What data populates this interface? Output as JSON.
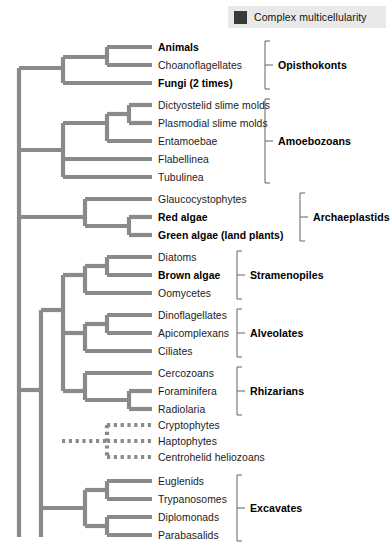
{
  "legend": {
    "swatch_color": "#3a3a3a",
    "label": "Complex multicellularity",
    "background": "#e9e9e9"
  },
  "style": {
    "branch_color": "#8a8a8a",
    "bracket_color": "#6f6f6f",
    "page_background": "#ffffff"
  },
  "chart_data": {
    "type": "diagram",
    "subtype": "cladogram",
    "title": "",
    "taxa": [
      {
        "name": "Animals",
        "bold": true,
        "y": 47,
        "tip_x": 150,
        "group": "Opisthokonts",
        "line": "solid"
      },
      {
        "name": "Choanoflagellates",
        "bold": false,
        "y": 65,
        "tip_x": 150,
        "group": "Opisthokonts",
        "line": "solid"
      },
      {
        "name": "Fungi (2 times)",
        "bold": true,
        "y": 83,
        "tip_x": 150,
        "group": "Opisthokonts",
        "line": "solid"
      },
      {
        "name": "Dictyostelid slime molds",
        "bold": false,
        "y": 105,
        "tip_x": 150,
        "group": "Amoebozoans",
        "line": "solid"
      },
      {
        "name": "Plasmodial slime molds",
        "bold": false,
        "y": 123,
        "tip_x": 150,
        "group": "Amoebozoans",
        "line": "solid"
      },
      {
        "name": "Entamoebae",
        "bold": false,
        "y": 141,
        "tip_x": 150,
        "group": "Amoebozoans",
        "line": "solid"
      },
      {
        "name": "Flabellinea",
        "bold": false,
        "y": 159,
        "tip_x": 150,
        "group": "Amoebozoans",
        "line": "solid"
      },
      {
        "name": "Tubulinea",
        "bold": false,
        "y": 177,
        "tip_x": 150,
        "group": "Amoebozoans",
        "line": "solid"
      },
      {
        "name": "Glaucocystophytes",
        "bold": false,
        "y": 199,
        "tip_x": 150,
        "group": "Archaeplastids",
        "line": "solid"
      },
      {
        "name": "Red algae",
        "bold": true,
        "y": 217,
        "tip_x": 150,
        "group": "Archaeplastids",
        "line": "solid"
      },
      {
        "name": "Green algae (land plants)",
        "bold": true,
        "y": 235,
        "tip_x": 150,
        "group": "Archaeplastids",
        "line": "solid"
      },
      {
        "name": "Diatoms",
        "bold": false,
        "y": 257,
        "tip_x": 150,
        "group": "Stramenopiles",
        "line": "solid"
      },
      {
        "name": "Brown algae",
        "bold": true,
        "y": 275,
        "tip_x": 150,
        "group": "Stramenopiles",
        "line": "solid"
      },
      {
        "name": "Oomycetes",
        "bold": false,
        "y": 293,
        "tip_x": 150,
        "group": "Stramenopiles",
        "line": "solid"
      },
      {
        "name": "Dinoflagellates",
        "bold": false,
        "y": 315,
        "tip_x": 150,
        "group": "Alveolates",
        "line": "solid"
      },
      {
        "name": "Apicomplexans",
        "bold": false,
        "y": 333,
        "tip_x": 150,
        "group": "Alveolates",
        "line": "solid"
      },
      {
        "name": "Ciliates",
        "bold": false,
        "y": 351,
        "tip_x": 150,
        "group": "Alveolates",
        "line": "solid"
      },
      {
        "name": "Cercozoans",
        "bold": false,
        "y": 373,
        "tip_x": 150,
        "group": "Rhizarians",
        "line": "solid"
      },
      {
        "name": "Foraminifera",
        "bold": false,
        "y": 391,
        "tip_x": 150,
        "group": "Rhizarians",
        "line": "solid"
      },
      {
        "name": "Radiolaria",
        "bold": false,
        "y": 409,
        "tip_x": 150,
        "group": "Rhizarians",
        "line": "solid"
      },
      {
        "name": "Cryptophytes",
        "bold": false,
        "y": 425,
        "tip_x": 150,
        "group": "",
        "line": "dotted"
      },
      {
        "name": "Haptophytes",
        "bold": false,
        "y": 441,
        "tip_x": 150,
        "group": "",
        "line": "dotted"
      },
      {
        "name": "Centrohelid heliozoans",
        "bold": false,
        "y": 457,
        "tip_x": 150,
        "group": "",
        "line": "dotted"
      },
      {
        "name": "Euglenids",
        "bold": false,
        "y": 481,
        "tip_x": 150,
        "group": "Excavates",
        "line": "solid"
      },
      {
        "name": "Trypanosomes",
        "bold": false,
        "y": 499,
        "tip_x": 150,
        "group": "Excavates",
        "line": "solid"
      },
      {
        "name": "Diplomonads",
        "bold": false,
        "y": 517,
        "tip_x": 150,
        "group": "Excavates",
        "line": "solid"
      },
      {
        "name": "Parabasalids",
        "bold": false,
        "y": 535,
        "tip_x": 150,
        "group": "Excavates",
        "line": "solid"
      }
    ],
    "groups": [
      {
        "label": "Opisthokonts",
        "top": 47,
        "bottom": 83,
        "bracket_x": 265,
        "label_x": 278
      },
      {
        "label": "Amoebozoans",
        "top": 105,
        "bottom": 177,
        "bracket_x": 265,
        "label_x": 278
      },
      {
        "label": "Archaeplastids",
        "top": 199,
        "bottom": 235,
        "bracket_x": 300,
        "label_x": 313
      },
      {
        "label": "Stramenopiles",
        "top": 257,
        "bottom": 293,
        "bracket_x": 237,
        "label_x": 250
      },
      {
        "label": "Alveolates",
        "top": 315,
        "bottom": 351,
        "bracket_x": 237,
        "label_x": 250
      },
      {
        "label": "Rhizarians",
        "top": 373,
        "bottom": 409,
        "bracket_x": 237,
        "label_x": 250
      },
      {
        "label": "Excavates",
        "top": 481,
        "bottom": 535,
        "bracket_x": 237,
        "label_x": 250
      }
    ],
    "branch_segments_solid": [
      [
        19,
        68,
        19,
        537
      ],
      [
        19,
        68,
        63,
        68
      ],
      [
        63,
        57,
        63,
        83
      ],
      [
        63,
        57,
        107,
        57
      ],
      [
        107,
        47,
        107,
        65
      ],
      [
        107,
        47,
        152,
        47
      ],
      [
        107,
        65,
        152,
        65
      ],
      [
        63,
        83,
        152,
        83
      ],
      [
        19,
        150,
        63,
        150
      ],
      [
        63,
        123,
        63,
        177
      ],
      [
        63,
        123,
        107,
        123
      ],
      [
        107,
        114,
        107,
        141
      ],
      [
        107,
        114,
        129,
        114
      ],
      [
        129,
        105,
        129,
        123
      ],
      [
        129,
        105,
        152,
        105
      ],
      [
        129,
        123,
        152,
        123
      ],
      [
        107,
        141,
        152,
        141
      ],
      [
        63,
        159,
        152,
        159
      ],
      [
        63,
        177,
        152,
        177
      ],
      [
        19,
        217,
        85,
        217
      ],
      [
        85,
        199,
        85,
        226
      ],
      [
        85,
        199,
        152,
        199
      ],
      [
        85,
        226,
        129,
        226
      ],
      [
        129,
        217,
        129,
        235
      ],
      [
        129,
        217,
        152,
        217
      ],
      [
        129,
        235,
        152,
        235
      ],
      [
        19,
        390,
        41,
        390
      ],
      [
        41,
        310,
        41,
        537
      ],
      [
        41,
        310,
        63,
        310
      ],
      [
        63,
        275,
        63,
        391
      ],
      [
        63,
        275,
        85,
        275
      ],
      [
        85,
        266,
        85,
        293
      ],
      [
        85,
        266,
        107,
        266
      ],
      [
        107,
        257,
        107,
        275
      ],
      [
        107,
        257,
        152,
        257
      ],
      [
        107,
        275,
        152,
        275
      ],
      [
        85,
        293,
        152,
        293
      ],
      [
        63,
        333,
        85,
        333
      ],
      [
        85,
        324,
        85,
        351
      ],
      [
        85,
        324,
        107,
        324
      ],
      [
        107,
        315,
        107,
        333
      ],
      [
        107,
        315,
        152,
        315
      ],
      [
        107,
        333,
        152,
        333
      ],
      [
        85,
        351,
        152,
        351
      ],
      [
        63,
        391,
        85,
        391
      ],
      [
        85,
        373,
        85,
        400
      ],
      [
        85,
        373,
        152,
        373
      ],
      [
        85,
        400,
        129,
        400
      ],
      [
        129,
        391,
        129,
        409
      ],
      [
        129,
        391,
        152,
        391
      ],
      [
        129,
        409,
        152,
        409
      ],
      [
        41,
        508,
        85,
        508
      ],
      [
        85,
        490,
        85,
        526
      ],
      [
        85,
        490,
        107,
        490
      ],
      [
        107,
        481,
        107,
        499
      ],
      [
        107,
        481,
        152,
        481
      ],
      [
        107,
        499,
        152,
        499
      ],
      [
        85,
        526,
        107,
        526
      ],
      [
        107,
        517,
        107,
        535
      ],
      [
        107,
        517,
        152,
        517
      ],
      [
        107,
        535,
        152,
        535
      ]
    ],
    "branch_segments_dotted": [
      [
        62,
        441,
        107,
        441
      ],
      [
        107,
        425,
        107,
        457
      ],
      [
        107,
        425,
        152,
        425
      ],
      [
        107,
        441,
        152,
        441
      ],
      [
        107,
        457,
        152,
        457
      ]
    ]
  }
}
